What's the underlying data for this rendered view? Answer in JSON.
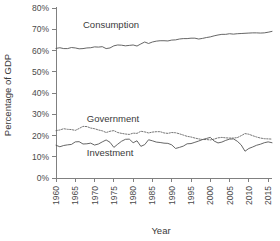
{
  "chart_data": {
    "type": "line",
    "title": "",
    "xlabel": "Year",
    "ylabel": "Percentage of GDP",
    "xlim": [
      1960,
      2016
    ],
    "ylim": [
      0,
      80
    ],
    "grid": false,
    "legend_position": "inline-annotations",
    "xticks": [
      1960,
      1965,
      1970,
      1975,
      1980,
      1985,
      1990,
      1995,
      2000,
      2005,
      2010,
      2015
    ],
    "xtick_labels": [
      "1960",
      "1965",
      "1970",
      "1975",
      "1980",
      "1985",
      "1990",
      "1995",
      "2000",
      "2005",
      "2010",
      "2015"
    ],
    "yticks": [
      0,
      10,
      20,
      30,
      40,
      50,
      60,
      70,
      80
    ],
    "ytick_labels": [
      "0%",
      "10%",
      "20%",
      "30%",
      "40%",
      "50%",
      "60%",
      "70%",
      "80%"
    ],
    "x": [
      1960,
      1961,
      1962,
      1963,
      1964,
      1965,
      1966,
      1967,
      1968,
      1969,
      1970,
      1971,
      1972,
      1973,
      1974,
      1975,
      1976,
      1977,
      1978,
      1979,
      1980,
      1981,
      1982,
      1983,
      1984,
      1985,
      1986,
      1987,
      1988,
      1989,
      1990,
      1991,
      1992,
      1993,
      1994,
      1995,
      1996,
      1997,
      1998,
      1999,
      2000,
      2001,
      2002,
      2003,
      2004,
      2005,
      2006,
      2007,
      2008,
      2009,
      2010,
      2011,
      2012,
      2013,
      2014,
      2015,
      2016
    ],
    "series": [
      {
        "name": "Consumption",
        "style": "solid",
        "color": "#555555",
        "label_x": 1967,
        "label_y": 72,
        "values": [
          61.0,
          61.3,
          60.9,
          60.9,
          61.4,
          61.2,
          60.8,
          60.9,
          61.2,
          61.3,
          61.7,
          61.6,
          61.8,
          60.9,
          61.2,
          62.2,
          62.6,
          62.5,
          62.2,
          62.4,
          62.6,
          62.1,
          63.1,
          64.0,
          63.3,
          64.0,
          64.4,
          64.6,
          64.6,
          64.5,
          64.9,
          65.0,
          65.4,
          65.6,
          65.6,
          65.8,
          65.8,
          65.4,
          65.7,
          66.1,
          66.4,
          66.9,
          67.3,
          67.6,
          67.6,
          67.9,
          67.7,
          67.9,
          68.0,
          68.1,
          68.2,
          68.3,
          68.3,
          68.2,
          68.3,
          68.6,
          69.0
        ]
      },
      {
        "name": "Government",
        "style": "dotted",
        "color": "#666666",
        "label_x": 1968,
        "label_y": 28,
        "values": [
          22.3,
          22.6,
          23.2,
          22.9,
          22.8,
          22.4,
          23.3,
          24.3,
          24.2,
          23.5,
          23.2,
          22.6,
          22.2,
          21.4,
          22.0,
          22.3,
          21.4,
          21.0,
          20.7,
          20.5,
          21.1,
          21.0,
          22.0,
          21.7,
          21.2,
          21.6,
          21.8,
          21.8,
          21.2,
          21.0,
          21.4,
          21.3,
          20.8,
          20.2,
          19.6,
          19.3,
          18.8,
          18.4,
          18.1,
          18.1,
          17.9,
          18.3,
          18.9,
          19.1,
          18.9,
          18.8,
          18.8,
          19.0,
          19.9,
          20.9,
          20.6,
          19.9,
          19.3,
          18.8,
          18.5,
          18.4,
          18.3
        ]
      },
      {
        "name": "Investment",
        "style": "solid",
        "color": "#555555",
        "label_x": 1968,
        "label_y": 12,
        "values": [
          15.4,
          14.7,
          15.3,
          15.6,
          15.8,
          17.0,
          17.1,
          16.0,
          16.1,
          16.4,
          15.5,
          16.0,
          17.0,
          17.9,
          16.8,
          14.4,
          15.9,
          17.3,
          18.2,
          18.3,
          16.6,
          17.5,
          14.9,
          15.7,
          18.0,
          17.5,
          16.9,
          16.7,
          16.4,
          16.3,
          15.6,
          13.9,
          14.4,
          15.0,
          16.1,
          16.2,
          16.8,
          17.4,
          18.1,
          18.6,
          19.1,
          17.4,
          16.5,
          16.9,
          17.7,
          18.3,
          18.4,
          17.3,
          15.6,
          12.6,
          13.9,
          14.6,
          15.4,
          15.9,
          16.6,
          17.0,
          16.6
        ]
      }
    ]
  }
}
